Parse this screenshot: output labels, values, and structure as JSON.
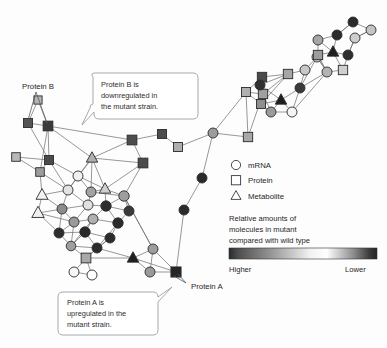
{
  "figure": {
    "background": "#fdfdfd",
    "width": 387,
    "height": 348
  },
  "annotations": {
    "protein_b_label": "Protein B",
    "protein_a_label": "Protein A",
    "callout_b": {
      "line1": "Protein B is",
      "line2": "downregulated in",
      "line3": "the mutant strain."
    },
    "callout_a": {
      "line1": "Protein A is",
      "line2": "upregulated in the",
      "line3": "mutant strain."
    }
  },
  "legend": {
    "items": [
      {
        "symbol": "circle-icon",
        "label": "mRNA"
      },
      {
        "symbol": "square-icon",
        "label": "Protein"
      },
      {
        "symbol": "triangle-icon",
        "label": "Metabolite"
      }
    ],
    "scale": {
      "title_line1": "Relative amounts of",
      "title_line2": "molecules in mutant",
      "title_line3": "compared with wild type",
      "left_label": "Higher",
      "right_label": "Lower",
      "gradient_stops": [
        "#2a2a2a",
        "#4d4d4d",
        "#9b9b9b",
        "#f2f2f2",
        "#ffffff",
        "#8d8d8d",
        "#3a3a3a",
        "#242424"
      ]
    }
  },
  "chart_data": {
    "type": "network",
    "title": "",
    "node_shapes": [
      "circle",
      "square",
      "triangle"
    ],
    "shade_meaning": "grayscale encodes relative abundance in mutant vs wild type; light = higher, dark = lower",
    "nodes": [
      {
        "id": 0,
        "x": 38,
        "y": 100,
        "shape": "square",
        "shade": "#b5b5b5",
        "r": 4.2
      },
      {
        "id": 1,
        "x": 28,
        "y": 123,
        "shape": "square",
        "shade": "#555555",
        "r": 4.6
      },
      {
        "id": 2,
        "x": 48,
        "y": 126,
        "shape": "square",
        "shade": "#3b3b3b",
        "r": 5.0
      },
      {
        "id": 3,
        "x": 16,
        "y": 157,
        "shape": "square",
        "shade": "#b8b8b8",
        "r": 4.4
      },
      {
        "id": 4,
        "x": 49,
        "y": 160,
        "shape": "square",
        "shade": "#4a4a4a",
        "r": 4.6
      },
      {
        "id": 5,
        "x": 40,
        "y": 172,
        "shape": "square",
        "shade": "#9d9d9d",
        "r": 4.4
      },
      {
        "id": 6,
        "x": 92,
        "y": 158,
        "shape": "triangle",
        "shade": "#b0b0b0",
        "r": 5.0
      },
      {
        "id": 7,
        "x": 143,
        "y": 163,
        "shape": "square",
        "shade": "#4b4b4b",
        "r": 5.0
      },
      {
        "id": 8,
        "x": 78,
        "y": 176,
        "shape": "circle",
        "shade": "#f0f0f0",
        "r": 5.0
      },
      {
        "id": 9,
        "x": 68,
        "y": 190,
        "shape": "circle",
        "shade": "#e3e3e3",
        "r": 5.0
      },
      {
        "id": 10,
        "x": 42,
        "y": 195,
        "shape": "triangle",
        "shade": "#f4f4f4",
        "r": 5.2
      },
      {
        "id": 11,
        "x": 91,
        "y": 192,
        "shape": "circle",
        "shade": "#a3a3a3",
        "r": 5.0
      },
      {
        "id": 12,
        "x": 105,
        "y": 189,
        "shape": "triangle",
        "shade": "#cfcfcf",
        "r": 5.0
      },
      {
        "id": 13,
        "x": 124,
        "y": 196,
        "shape": "circle",
        "shade": "#9e9e9e",
        "r": 5.2
      },
      {
        "id": 14,
        "x": 88,
        "y": 205,
        "shape": "circle",
        "shade": "#e0e0e0",
        "r": 5.0
      },
      {
        "id": 15,
        "x": 38,
        "y": 213,
        "shape": "triangle",
        "shade": "#f0f0f0",
        "r": 5.4
      },
      {
        "id": 16,
        "x": 62,
        "y": 209,
        "shape": "circle",
        "shade": "#8c8c8c",
        "r": 5.0
      },
      {
        "id": 17,
        "x": 106,
        "y": 206,
        "shape": "circle",
        "shade": "#2e2e2e",
        "r": 5.2
      },
      {
        "id": 18,
        "x": 129,
        "y": 211,
        "shape": "circle",
        "shade": "#3a3a3a",
        "r": 5.0
      },
      {
        "id": 19,
        "x": 74,
        "y": 222,
        "shape": "circle",
        "shade": "#9a9a9a",
        "r": 5.0
      },
      {
        "id": 20,
        "x": 93,
        "y": 219,
        "shape": "circle",
        "shade": "#b0b0b0",
        "r": 5.0
      },
      {
        "id": 21,
        "x": 118,
        "y": 223,
        "shape": "circle",
        "shade": "#2b2b2b",
        "r": 5.2
      },
      {
        "id": 22,
        "x": 59,
        "y": 233,
        "shape": "circle",
        "shade": "#2d2d2d",
        "r": 5.0
      },
      {
        "id": 23,
        "x": 85,
        "y": 232,
        "shape": "circle",
        "shade": "#2a2a2a",
        "r": 5.2
      },
      {
        "id": 24,
        "x": 110,
        "y": 238,
        "shape": "circle",
        "shade": "#2c2c2c",
        "r": 5.0
      },
      {
        "id": 25,
        "x": 71,
        "y": 246,
        "shape": "circle",
        "shade": "#9f9f9f",
        "r": 4.8
      },
      {
        "id": 26,
        "x": 97,
        "y": 248,
        "shape": "circle",
        "shade": "#2b2b2b",
        "r": 5.0
      },
      {
        "id": 27,
        "x": 86,
        "y": 258,
        "shape": "square",
        "shade": "#a8a8a8",
        "r": 5.0
      },
      {
        "id": 28,
        "x": 74,
        "y": 272,
        "shape": "circle",
        "shade": "#f6f6f6",
        "r": 5.0
      },
      {
        "id": 29,
        "x": 92,
        "y": 275,
        "shape": "circle",
        "shade": "#ffffff",
        "r": 5.0
      },
      {
        "id": 30,
        "x": 133,
        "y": 258,
        "shape": "triangle",
        "shade": "#1f1f1f",
        "r": 5.0
      },
      {
        "id": 31,
        "x": 153,
        "y": 249,
        "shape": "circle",
        "shade": "#9e9e9e",
        "r": 5.0
      },
      {
        "id": 32,
        "x": 150,
        "y": 272,
        "shape": "circle",
        "shade": "#9a9a9a",
        "r": 5.0
      },
      {
        "id": 33,
        "x": 176,
        "y": 272,
        "shape": "square",
        "shade": "#262626",
        "r": 5.2
      },
      {
        "id": 34,
        "x": 132,
        "y": 140,
        "shape": "square",
        "shade": "#4d4d4d",
        "r": 5.0
      },
      {
        "id": 35,
        "x": 162,
        "y": 134,
        "shape": "square",
        "shade": "#4c4c4c",
        "r": 4.6
      },
      {
        "id": 36,
        "x": 178,
        "y": 147,
        "shape": "square",
        "shade": "#aeaeae",
        "r": 4.6
      },
      {
        "id": 37,
        "x": 213,
        "y": 133,
        "shape": "circle",
        "shade": "#9c9c9c",
        "r": 5.0
      },
      {
        "id": 38,
        "x": 248,
        "y": 137,
        "shape": "square",
        "shade": "#a7a7a7",
        "r": 4.8
      },
      {
        "id": 39,
        "x": 202,
        "y": 178,
        "shape": "circle",
        "shade": "#2a2a2a",
        "r": 5.0
      },
      {
        "id": 40,
        "x": 184,
        "y": 210,
        "shape": "circle",
        "shade": "#2b2b2b",
        "r": 5.0
      },
      {
        "id": 41,
        "x": 262,
        "y": 77,
        "shape": "square",
        "shade": "#4a4a4a",
        "r": 4.8
      },
      {
        "id": 42,
        "x": 288,
        "y": 74,
        "shape": "square",
        "shade": "#a6a6a6",
        "r": 4.8
      },
      {
        "id": 43,
        "x": 246,
        "y": 92,
        "shape": "square",
        "shade": "#b0b0b0",
        "r": 4.6
      },
      {
        "id": 44,
        "x": 263,
        "y": 94,
        "shape": "square",
        "shade": "#a0a0a0",
        "r": 4.8
      },
      {
        "id": 45,
        "x": 261,
        "y": 104,
        "shape": "square",
        "shade": "#8f8f8f",
        "r": 4.6
      },
      {
        "id": 46,
        "x": 281,
        "y": 100,
        "shape": "triangle",
        "shade": "#1f1f1f",
        "r": 5.0
      },
      {
        "id": 47,
        "x": 271,
        "y": 112,
        "shape": "circle",
        "shade": "#9b9b9b",
        "r": 5.0
      },
      {
        "id": 48,
        "x": 292,
        "y": 112,
        "shape": "circle",
        "shade": "#f4f4f4",
        "r": 5.0
      },
      {
        "id": 49,
        "x": 260,
        "y": 85,
        "shape": "circle",
        "shade": "#303030",
        "r": 5.0
      },
      {
        "id": 50,
        "x": 305,
        "y": 70,
        "shape": "circle",
        "shade": "#c8c8c8",
        "r": 5.0
      },
      {
        "id": 51,
        "x": 300,
        "y": 88,
        "shape": "circle",
        "shade": "#3a3a3a",
        "r": 5.0
      },
      {
        "id": 52,
        "x": 317,
        "y": 57,
        "shape": "circle",
        "shade": "#cacaca",
        "r": 5.0
      },
      {
        "id": 53,
        "x": 318,
        "y": 40,
        "shape": "circle",
        "shade": "#a6a6a6",
        "r": 5.0
      },
      {
        "id": 54,
        "x": 337,
        "y": 35,
        "shape": "circle",
        "shade": "#2c2c2c",
        "r": 5.0
      },
      {
        "id": 55,
        "x": 355,
        "y": 38,
        "shape": "circle",
        "shade": "#cdcdcd",
        "r": 5.0
      },
      {
        "id": 56,
        "x": 333,
        "y": 52,
        "shape": "triangle",
        "shade": "#1f1f1f",
        "r": 5.0
      },
      {
        "id": 57,
        "x": 318,
        "y": 55,
        "shape": "square",
        "shade": "#9d9d9d",
        "r": 4.8
      },
      {
        "id": 58,
        "x": 348,
        "y": 55,
        "shape": "circle",
        "shade": "#2e2e2e",
        "r": 5.0
      },
      {
        "id": 59,
        "x": 343,
        "y": 70,
        "shape": "square",
        "shade": "#cfcfcf",
        "r": 4.8
      },
      {
        "id": 60,
        "x": 327,
        "y": 72,
        "shape": "circle",
        "shade": "#b4b4b4",
        "r": 5.0
      },
      {
        "id": 61,
        "x": 353,
        "y": 22,
        "shape": "circle",
        "shade": "#2b2b2b",
        "r": 5.0
      },
      {
        "id": 62,
        "x": 371,
        "y": 30,
        "shape": "circle",
        "shade": "#c4c4c4",
        "r": 5.0
      }
    ],
    "edges": [
      [
        0,
        2
      ],
      [
        0,
        1
      ],
      [
        1,
        2
      ],
      [
        2,
        4
      ],
      [
        2,
        5
      ],
      [
        1,
        4
      ],
      [
        3,
        5
      ],
      [
        3,
        4
      ],
      [
        4,
        5
      ],
      [
        2,
        6
      ],
      [
        2,
        34
      ],
      [
        4,
        8
      ],
      [
        4,
        9
      ],
      [
        5,
        9
      ],
      [
        5,
        10
      ],
      [
        6,
        8
      ],
      [
        6,
        9
      ],
      [
        6,
        11
      ],
      [
        6,
        12
      ],
      [
        8,
        9
      ],
      [
        8,
        11
      ],
      [
        8,
        12
      ],
      [
        9,
        10
      ],
      [
        9,
        14
      ],
      [
        9,
        16
      ],
      [
        10,
        15
      ],
      [
        10,
        16
      ],
      [
        11,
        12
      ],
      [
        11,
        13
      ],
      [
        11,
        14
      ],
      [
        12,
        13
      ],
      [
        12,
        17
      ],
      [
        13,
        17
      ],
      [
        13,
        18
      ],
      [
        14,
        16
      ],
      [
        14,
        17
      ],
      [
        14,
        19
      ],
      [
        15,
        16
      ],
      [
        15,
        19
      ],
      [
        15,
        22
      ],
      [
        16,
        19
      ],
      [
        16,
        22
      ],
      [
        17,
        18
      ],
      [
        17,
        20
      ],
      [
        17,
        21
      ],
      [
        18,
        21
      ],
      [
        19,
        20
      ],
      [
        19,
        22
      ],
      [
        19,
        25
      ],
      [
        20,
        21
      ],
      [
        20,
        23
      ],
      [
        20,
        25
      ],
      [
        21,
        24
      ],
      [
        21,
        26
      ],
      [
        22,
        23
      ],
      [
        22,
        25
      ],
      [
        23,
        24
      ],
      [
        23,
        26
      ],
      [
        23,
        25
      ],
      [
        24,
        26
      ],
      [
        25,
        26
      ],
      [
        25,
        27
      ],
      [
        26,
        27
      ],
      [
        27,
        28
      ],
      [
        27,
        29
      ],
      [
        27,
        30
      ],
      [
        27,
        24
      ],
      [
        28,
        29
      ],
      [
        30,
        31
      ],
      [
        30,
        32
      ],
      [
        30,
        33
      ],
      [
        31,
        32
      ],
      [
        31,
        33
      ],
      [
        32,
        33
      ],
      [
        30,
        26
      ],
      [
        31,
        13
      ],
      [
        13,
        31
      ],
      [
        7,
        13
      ],
      [
        7,
        34
      ],
      [
        7,
        12
      ],
      [
        7,
        6
      ],
      [
        34,
        35
      ],
      [
        34,
        6
      ],
      [
        35,
        36
      ],
      [
        36,
        37
      ],
      [
        37,
        38
      ],
      [
        37,
        39
      ],
      [
        39,
        40
      ],
      [
        40,
        33
      ],
      [
        38,
        44
      ],
      [
        37,
        43
      ],
      [
        41,
        43
      ],
      [
        41,
        44
      ],
      [
        41,
        49
      ],
      [
        42,
        44
      ],
      [
        42,
        45
      ],
      [
        43,
        44
      ],
      [
        43,
        45
      ],
      [
        44,
        45
      ],
      [
        44,
        47
      ],
      [
        45,
        46
      ],
      [
        45,
        47
      ],
      [
        46,
        47
      ],
      [
        46,
        48
      ],
      [
        47,
        48
      ],
      [
        49,
        42
      ],
      [
        49,
        46
      ],
      [
        48,
        51
      ],
      [
        50,
        51
      ],
      [
        50,
        52
      ],
      [
        51,
        52
      ],
      [
        42,
        50
      ],
      [
        52,
        57
      ],
      [
        53,
        57
      ],
      [
        53,
        54
      ],
      [
        54,
        56
      ],
      [
        54,
        61
      ],
      [
        55,
        58
      ],
      [
        56,
        57
      ],
      [
        56,
        58
      ],
      [
        56,
        59
      ],
      [
        57,
        60
      ],
      [
        58,
        59
      ],
      [
        59,
        60
      ],
      [
        60,
        52
      ],
      [
        61,
        62
      ],
      [
        61,
        54
      ],
      [
        62,
        55
      ],
      [
        55,
        62
      ],
      [
        53,
        56
      ],
      [
        58,
        55
      ],
      [
        52,
        60
      ],
      [
        48,
        60
      ],
      [
        51,
        60
      ],
      [
        41,
        42
      ],
      [
        38,
        43
      ],
      [
        46,
        51
      ],
      [
        45,
        49
      ]
    ]
  }
}
